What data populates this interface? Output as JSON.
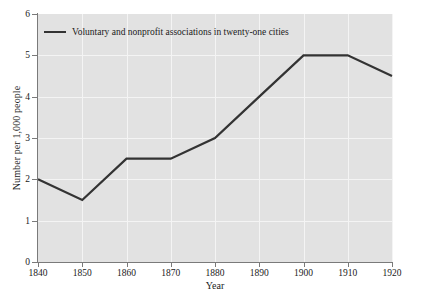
{
  "chart_data": {
    "type": "line",
    "title": "",
    "subtitle": "",
    "xlabel": "Year",
    "ylabel": "Number per 1,000 people",
    "x": [
      1840,
      1850,
      1860,
      1870,
      1880,
      1890,
      1900,
      1910,
      1920
    ],
    "xtick_labels": [
      "1840",
      "1850",
      "1860",
      "1870",
      "1880",
      "1890",
      "1900",
      "1910",
      "1920"
    ],
    "ytick_labels": [
      "0",
      "1",
      "2",
      "3",
      "4",
      "5",
      "6"
    ],
    "yticks": [
      0,
      1,
      2,
      3,
      4,
      5,
      6
    ],
    "xlim": [
      1840,
      1920
    ],
    "ylim": [
      0,
      6
    ],
    "grid": true,
    "legend_position": "top-left",
    "series": [
      {
        "name": "Voluntary and nonprofit associations in twenty-one cities",
        "values": [
          2.0,
          1.5,
          2.5,
          2.5,
          3.0,
          4.0,
          5.0,
          5.0,
          4.5
        ],
        "color": "#333333"
      }
    ],
    "colors": {
      "line": "#333333",
      "plot_background": "#e2e2e2",
      "gridline": "#f4f4f4",
      "axis": "#7a7a7a",
      "text": "#1a1a1a",
      "figure_background": "#ffffff"
    }
  }
}
